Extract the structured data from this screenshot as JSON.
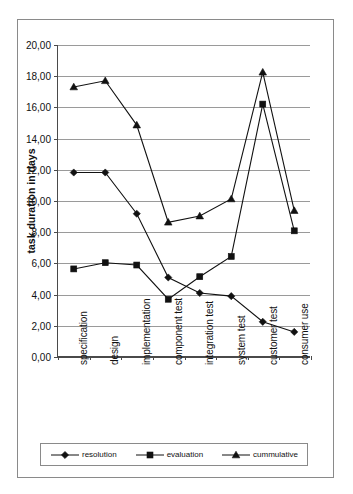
{
  "chart_data": {
    "type": "line",
    "title": "",
    "xlabel": "",
    "ylabel": "task duration in days",
    "ylim": [
      0,
      20
    ],
    "ytick_step": 2,
    "grid": true,
    "legend_position": "bottom",
    "categories": [
      "specification",
      "design",
      "implementation",
      "component test",
      "integration test",
      "system test",
      "customer test",
      "consumer use"
    ],
    "ytick_labels": [
      "0,00",
      "2,00",
      "4,00",
      "6,00",
      "8,00",
      "10,00",
      "12,00",
      "14,00",
      "16,00",
      "18,00",
      "20,00"
    ],
    "series": [
      {
        "name": "resolution",
        "marker": "diamond",
        "values": [
          11.8,
          11.8,
          9.15,
          5.05,
          4.05,
          3.85,
          2.2,
          1.55
        ]
      },
      {
        "name": "evaluation",
        "marker": "square",
        "values": [
          5.6,
          6.0,
          5.85,
          3.65,
          5.1,
          6.4,
          16.2,
          8.05
        ]
      },
      {
        "name": "cummulative",
        "marker": "triangle",
        "values": [
          17.3,
          17.7,
          14.85,
          8.6,
          9.0,
          10.1,
          18.25,
          9.35
        ]
      }
    ],
    "colors": {
      "line": "#111111",
      "grid": "#9a9a9a",
      "axis": "#4a4a4a",
      "frame": "#8a8a8a",
      "background": "#ffffff"
    }
  },
  "legend": {
    "items": [
      {
        "label": "resolution"
      },
      {
        "label": "evaluation"
      },
      {
        "label": "cummulative"
      }
    ]
  }
}
